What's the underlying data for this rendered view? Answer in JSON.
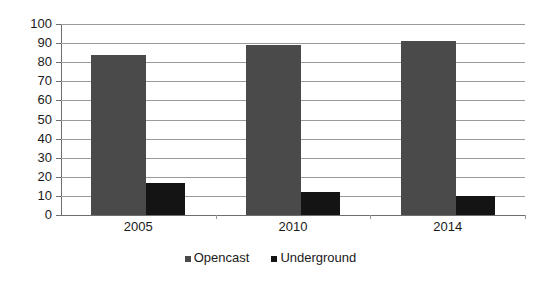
{
  "chart_data": {
    "type": "bar",
    "title": "",
    "xlabel": "",
    "ylabel": "",
    "categories": [
      "2005",
      "2010",
      "2014"
    ],
    "series": [
      {
        "name": "Opencast",
        "color": "#4a4a4a",
        "values": [
          84,
          89,
          91
        ]
      },
      {
        "name": "Underground",
        "color": "#141414",
        "values": [
          17,
          12,
          10
        ]
      }
    ],
    "ylim": [
      0,
      100
    ],
    "ytick_step": 10,
    "yticks": [
      "100",
      "90",
      "80",
      "70",
      "60",
      "50",
      "40",
      "30",
      "20",
      "10",
      "0"
    ],
    "grid": true,
    "grid_axis": "y",
    "legend_position": "bottom",
    "bar_gap_within_group": 0
  },
  "legend": {
    "entries": [
      {
        "label": "Opencast"
      },
      {
        "label": "Underground"
      }
    ]
  },
  "axes": {
    "y": {
      "labels": [
        "100",
        "90",
        "80",
        "70",
        "60",
        "50",
        "40",
        "30",
        "20",
        "10",
        "0"
      ]
    },
    "x": {
      "labels": [
        "2005",
        "2010",
        "2014"
      ]
    }
  },
  "colors": {
    "opencast": "#4a4a4a",
    "underground": "#141414",
    "gridline": "#9a9a9a",
    "axis": "#6e6e6e",
    "background": "#ffffff",
    "text": "#1a1a1a"
  }
}
